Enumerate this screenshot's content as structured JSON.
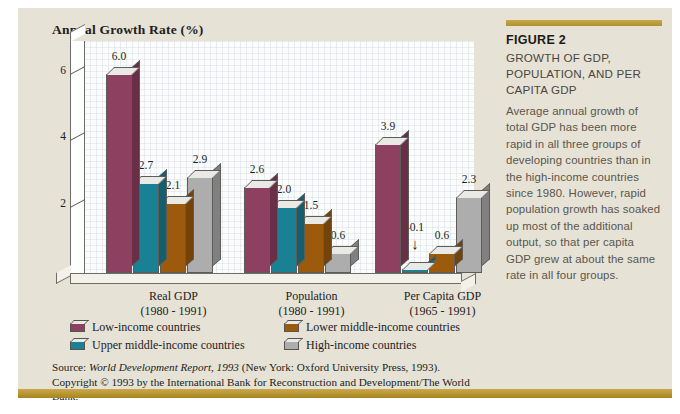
{
  "chart_data": {
    "type": "bar",
    "title": "Annual Growth Rate (%)",
    "xlabel": "",
    "ylabel": "Annual Growth Rate (%)",
    "ylim": [
      -0.6,
      7.0
    ],
    "yticks": [
      2,
      4,
      6
    ],
    "grid": true,
    "legend_position": "bottom",
    "categories": [
      "Real GDP\n(1980 - 1991)",
      "Population\n(1980 - 1991)",
      "Per Capita GDP\n(1965 - 1991)"
    ],
    "series": [
      {
        "name": "Low-income countries",
        "color": "#8e4060",
        "values": [
          6.0,
          2.6,
          3.9
        ]
      },
      {
        "name": "Upper middle-income countries",
        "color": "#1a8094",
        "values": [
          2.7,
          2.0,
          -0.1
        ]
      },
      {
        "name": "Lower middle-income countries",
        "color": "#9c5a0c",
        "values": [
          2.1,
          1.5,
          0.6
        ]
      },
      {
        "name": "High-income countries",
        "color": "#adadad",
        "values": [
          2.9,
          0.6,
          2.3
        ]
      }
    ],
    "annotations": [
      {
        "text": "-0.1",
        "note": "arrow pointing down to the small negative Upper middle-income bar in Per Capita GDP group"
      }
    ]
  },
  "chart": {
    "title": "Annual Growth Rate (%)",
    "groups": [
      {
        "name": "Real GDP",
        "label_line1": "Real GDP",
        "label_line2": "(1980 - 1991)",
        "bars": [
          {
            "series": "Low-income countries",
            "value": 6.0,
            "label": "6.0",
            "color": "#8e4060"
          },
          {
            "series": "Upper middle-income countries",
            "value": 2.7,
            "label": "2.7",
            "color": "#1a8094"
          },
          {
            "series": "Lower middle-income countries",
            "value": 2.1,
            "label": "2.1",
            "color": "#9c5a0c"
          },
          {
            "series": "High-income countries",
            "value": 2.9,
            "label": "2.9",
            "color": "#adadad"
          }
        ]
      },
      {
        "name": "Population",
        "label_line1": "Population",
        "label_line2": "(1980 - 1991)",
        "bars": [
          {
            "series": "Low-income countries",
            "value": 2.6,
            "label": "2.6",
            "color": "#8e4060"
          },
          {
            "series": "Upper middle-income countries",
            "value": 2.0,
            "label": "2.0",
            "color": "#1a8094"
          },
          {
            "series": "Lower middle-income countries",
            "value": 1.5,
            "label": "1.5",
            "color": "#9c5a0c"
          },
          {
            "series": "High-income countries",
            "value": 0.6,
            "label": "0.6",
            "color": "#adadad"
          }
        ]
      },
      {
        "name": "Per Capita GDP",
        "label_line1": "Per Capita GDP",
        "label_line2": "(1965 - 1991)",
        "bars": [
          {
            "series": "Low-income countries",
            "value": 3.9,
            "label": "3.9",
            "color": "#8e4060"
          },
          {
            "series": "Upper middle-income countries",
            "value": -0.1,
            "label": "-0.1",
            "color": "#1a8094"
          },
          {
            "series": "Lower middle-income countries",
            "value": 0.6,
            "label": "0.6",
            "color": "#9c5a0c"
          },
          {
            "series": "High-income countries",
            "value": 2.3,
            "label": "2.3",
            "color": "#adadad"
          }
        ]
      }
    ],
    "yticks": [
      {
        "label": "6"
      },
      {
        "label": "4"
      },
      {
        "label": "2"
      }
    ],
    "neg_arrow_glyph": "↓"
  },
  "legend": {
    "items": [
      {
        "label": "Low-income countries",
        "color": "#8e4060"
      },
      {
        "label": "Lower middle-income countries",
        "color": "#9c5a0c"
      },
      {
        "label": "Upper middle-income countries",
        "color": "#1a8094"
      },
      {
        "label": "High-income countries",
        "color": "#adadad"
      }
    ]
  },
  "source": {
    "prefix": "Source: ",
    "italic_title": "World Development Report, 1993",
    "rest": " (New York: Oxford University Press, 1993). Copyright © 1993 by the International Bank for Reconstruction and Development/The World Bank."
  },
  "caption": {
    "figure_number": "FIGURE 2",
    "heading": "GROWTH OF GDP, POPULATION, AND PER CAPITA GDP",
    "body": "Average annual growth of total GDP has been more rapid in all three groups of developing countries than in the high-income countries since 1980. However, rapid population growth has soaked up most of the additional output, so that per capita GDP grew at about the same rate in all four groups."
  }
}
